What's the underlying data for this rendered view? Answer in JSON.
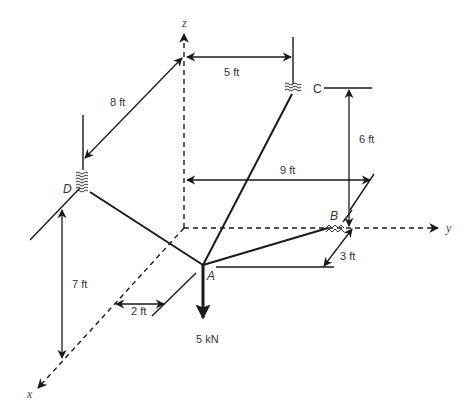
{
  "diagram": {
    "type": "3D statics free-body / cable support diagram",
    "axes": {
      "x": "x",
      "y": "y",
      "z": "z"
    },
    "points": {
      "A": "A",
      "B": "B",
      "C": "C",
      "D": "D"
    },
    "dimensions": {
      "d_8ft": "8 ft",
      "d_5ft": "5 ft",
      "d_6ft": "6 ft",
      "d_9ft": "9 ft",
      "d_7ft": "7 ft",
      "d_2ft": "2 ft",
      "d_3ft": "3 ft"
    },
    "load": {
      "label": "5 kN",
      "direction": "down",
      "applied_at": "A"
    },
    "cables": [
      "AB",
      "AC",
      "AD"
    ],
    "colors": {
      "line": "#1a1a1a",
      "text": "#333333",
      "background": "#ffffff"
    }
  }
}
